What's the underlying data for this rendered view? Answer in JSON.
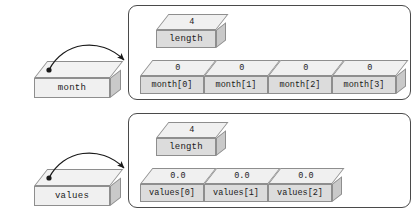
{
  "diagram": {
    "groups": [
      {
        "id": "month-group",
        "reference": {
          "name": "month"
        },
        "length_box": {
          "value": "4",
          "label": "length"
        },
        "elements": [
          {
            "value": "0",
            "label": "month[0]"
          },
          {
            "value": "0",
            "label": "month[1]"
          },
          {
            "value": "0",
            "label": "month[2]"
          },
          {
            "value": "0",
            "label": "month[3]"
          }
        ]
      },
      {
        "id": "values-group",
        "reference": {
          "name": "values"
        },
        "length_box": {
          "value": "4",
          "label": "length"
        },
        "elements": [
          {
            "value": "0.0",
            "label": "values[0]"
          },
          {
            "value": "0.0",
            "label": "values[1]"
          },
          {
            "value": "0.0",
            "label": "values[2]"
          }
        ]
      }
    ],
    "colors": {
      "background": "#ffffff",
      "panel_border": "#4a4a4a",
      "box_outline": "#8e8e8e",
      "box_top_face": "#f0f0f0",
      "box_front_face": "#dcdcdc",
      "box_side_face": "#c9c9c9",
      "arrow": "#1a1a1a",
      "text": "#1a1a1a"
    }
  }
}
